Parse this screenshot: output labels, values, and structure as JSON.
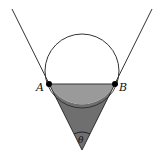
{
  "diagram": {
    "labels": {
      "point_a": "A",
      "point_b": "B",
      "angle": "θ"
    },
    "colors": {
      "stroke": "#333333",
      "segment_fill": "#9a9a9a",
      "lower_fill": "#6f6f6f",
      "background": "#ffffff"
    }
  }
}
